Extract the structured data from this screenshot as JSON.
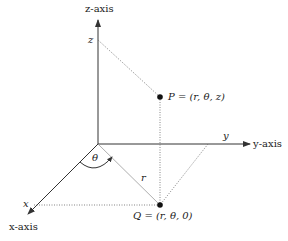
{
  "diagram": {
    "axes": {
      "z_axis_label": "z-axis",
      "y_axis_label": "y-axis",
      "x_axis_label": "x-axis",
      "z_tick": "z",
      "y_tick": "y",
      "x_tick": "x"
    },
    "points": {
      "P": "P = (r, θ, z)",
      "Q": "Q = (r, θ, 0)"
    },
    "labels": {
      "r": "r",
      "theta": "θ"
    },
    "colors": {
      "line": "#333333",
      "dotted": "#666666",
      "point": "#111111"
    }
  }
}
